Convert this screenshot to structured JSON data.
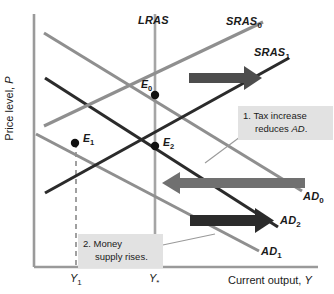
{
  "figure": {
    "type": "economics-ad-as-diagram",
    "width": 334,
    "height": 294,
    "background": "#ffffff"
  },
  "axes": {
    "y_title": "Price level, P",
    "y_title_italic_part": "P",
    "x_title": "Current output, Y",
    "x_title_italic_part": "Y",
    "axis_color": "#9a9a9a",
    "x_ticks": [
      {
        "label": "Y",
        "sub": "1",
        "x": 78
      },
      {
        "label": "Y",
        "sub": "*",
        "x": 157
      }
    ]
  },
  "curves": [
    {
      "name": "LRAS",
      "label": "LRAS",
      "sub": "",
      "color": "#9a9a9a",
      "kind": "vertical"
    },
    {
      "name": "SRAS0",
      "label": "SRAS",
      "sub": "0",
      "color": "#8f8f8f",
      "kind": "upward"
    },
    {
      "name": "SRAS1",
      "label": "SRAS",
      "sub": "1",
      "color": "#2b2b2b",
      "kind": "upward"
    },
    {
      "name": "AD0",
      "label": "AD",
      "sub": "0",
      "color": "#8f8f8f",
      "kind": "downward"
    },
    {
      "name": "AD2",
      "label": "AD",
      "sub": "2",
      "color": "#2b2b2b",
      "kind": "downward"
    },
    {
      "name": "AD1",
      "label": "AD",
      "sub": "1",
      "color": "#8f8f8f",
      "kind": "downward"
    }
  ],
  "equilibria": [
    {
      "name": "E0",
      "label": "E",
      "sub": "0",
      "x": 155,
      "y": 95
    },
    {
      "name": "E1",
      "label": "E",
      "sub": "1",
      "x": 75,
      "y": 143
    },
    {
      "name": "E2",
      "label": "E",
      "sub": "2",
      "x": 155,
      "y": 146
    }
  ],
  "annotations": [
    {
      "id": "tax-increase",
      "line1": "1. Tax increase",
      "line2": "reduces AD.",
      "line2_italic": "AD"
    },
    {
      "id": "money-supply",
      "line1": "2. Money",
      "line2": "supply rises."
    }
  ],
  "arrows": [
    {
      "id": "sras-shift-arrow",
      "direction": "right",
      "color": "#4d4d4d",
      "meaning": "SRAS0 to SRAS1"
    },
    {
      "id": "ad-decrease-arrow",
      "direction": "left",
      "color": "#707070",
      "meaning": "AD0 to AD1"
    },
    {
      "id": "ad-increase-arrow",
      "direction": "right",
      "color": "#2b2b2b",
      "meaning": "AD1 to AD2"
    }
  ],
  "chart_data": {
    "type": "line",
    "title": "",
    "xlabel": "Current output, Y",
    "ylabel": "Price level, P",
    "grid": false,
    "legend": "inline-curve-labels",
    "xlim": [
      34,
      334
    ],
    "ylim": [
      0,
      267
    ],
    "series": [
      {
        "name": "LRAS",
        "points": [
          [
            155,
            14
          ],
          [
            155,
            267
          ]
        ],
        "color": "#9a9a9a",
        "style": "vertical"
      },
      {
        "name": "SRAS0",
        "points": [
          [
            44,
            126
          ],
          [
            262,
            22
          ]
        ],
        "color": "#8f8f8f",
        "style": "solid"
      },
      {
        "name": "SRAS1",
        "points": [
          [
            45,
            192
          ],
          [
            288,
            58
          ]
        ],
        "color": "#2b2b2b",
        "style": "solid"
      },
      {
        "name": "AD0",
        "points": [
          [
            44,
            33
          ],
          [
            300,
            190
          ]
        ],
        "color": "#8f8f8f",
        "style": "solid"
      },
      {
        "name": "AD2",
        "points": [
          [
            45,
            78
          ],
          [
            277,
            226
          ]
        ],
        "color": "#2b2b2b",
        "style": "solid"
      },
      {
        "name": "AD1",
        "points": [
          [
            36,
            133
          ],
          [
            258,
            250
          ]
        ],
        "color": "#8f8f8f",
        "style": "solid"
      }
    ],
    "markers": [
      {
        "name": "E0",
        "x": 155,
        "y": 95
      },
      {
        "name": "E1",
        "x": 75,
        "y": 143
      },
      {
        "name": "E2",
        "x": 155,
        "y": 146
      }
    ],
    "xticks": [
      {
        "label": "Y1",
        "x": 78
      },
      {
        "label": "Y*",
        "x": 157
      }
    ]
  }
}
